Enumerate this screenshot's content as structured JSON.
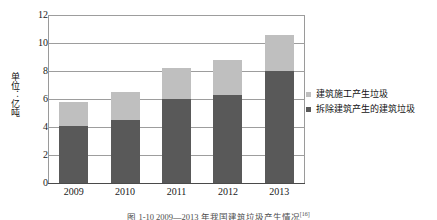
{
  "chart_data": {
    "type": "bar",
    "stacked": true,
    "title": "",
    "xlabel": "",
    "ylabel": "单位：亿吨",
    "categories": [
      "2009",
      "2010",
      "2011",
      "2012",
      "2013"
    ],
    "series": [
      {
        "name": "拆除建筑产生的建筑垃圾",
        "color": "#595959",
        "values": [
          4.1,
          4.5,
          6.0,
          6.3,
          8.0
        ]
      },
      {
        "name": "建筑施工产生垃圾",
        "color": "#bfbfbf",
        "values": [
          1.7,
          2.0,
          2.2,
          2.5,
          2.6
        ]
      }
    ],
    "totals": [
      5.8,
      6.5,
      8.2,
      8.8,
      10.6
    ],
    "ylim": [
      0,
      12
    ],
    "yticks": [
      0,
      2,
      4,
      6,
      8,
      10,
      12
    ],
    "ytick_labels": [
      "0",
      "2",
      "4",
      "6",
      "8",
      "10",
      "12"
    ],
    "grid": true,
    "legend_position": "right"
  },
  "axis": {
    "y_title": "单位：亿吨",
    "ticks": [
      "12",
      "10",
      "8",
      "6",
      "4",
      "2",
      "0"
    ],
    "x_categories": [
      "2009",
      "2010",
      "2011",
      "2012",
      "2013"
    ]
  },
  "legend": {
    "items": [
      {
        "label": "建筑施工产生垃圾",
        "color": "#bfbfbf"
      },
      {
        "label": "拆除建筑产生的建筑垃圾",
        "color": "#595959"
      }
    ]
  },
  "caption": {
    "text": "图 1-10  2009—2013 年我国建筑垃圾产生情况",
    "ref": "[16]"
  },
  "colors": {
    "construction_waste": "#bfbfbf",
    "demolition_waste": "#595959",
    "gridline": "#9d9d9d",
    "axis": "#4a4a4a",
    "background": "#ffffff"
  }
}
